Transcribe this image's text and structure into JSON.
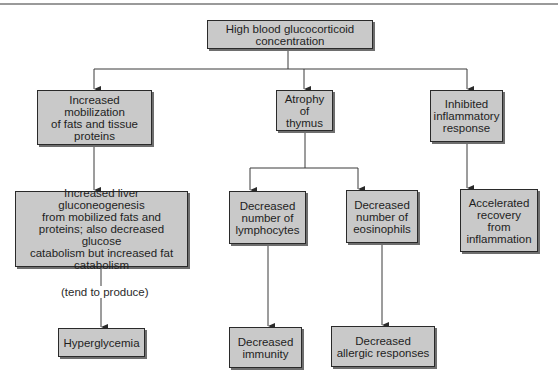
{
  "diagram": {
    "type": "flowchart",
    "colors": {
      "box_fill": "#c9c9c9",
      "box_border": "#2a2a2a",
      "line": "#3a3a3a",
      "background": "#ffffff"
    },
    "nodes": {
      "root": "High blood glucocorticoid concentration",
      "mobilization": "Increased mobilization\nof fats and tissue\nproteins",
      "thymus": "Atrophy\nof thymus",
      "inflammatory": "Inhibited\ninflammatory\nresponse",
      "gluconeogenesis": "Increased liver gluconeogenesis\nfrom mobilized fats and\nproteins; also decreased glucose\ncatabolism but increased fat\ncatabolism",
      "lymphocytes": "Decreased\nnumber of\nlymphocytes",
      "eosinophils": "Decreased\nnumber of\neosinophils",
      "recovery": "Accelerated\nrecovery\nfrom\ninflammation",
      "hyperglycemia": "Hyperglycemia",
      "immunity": "Decreased\nimmunity",
      "allergic": "Decreased\nallergic responses"
    },
    "edge_labels": {
      "tend_to_produce": "(tend to produce)"
    },
    "edges": [
      [
        "root",
        "mobilization"
      ],
      [
        "root",
        "thymus"
      ],
      [
        "root",
        "inflammatory"
      ],
      [
        "mobilization",
        "gluconeogenesis"
      ],
      [
        "thymus",
        "lymphocytes"
      ],
      [
        "thymus",
        "eosinophils"
      ],
      [
        "inflammatory",
        "recovery"
      ],
      [
        "gluconeogenesis",
        "hyperglycemia"
      ],
      [
        "lymphocytes",
        "immunity"
      ],
      [
        "eosinophils",
        "allergic"
      ]
    ]
  }
}
